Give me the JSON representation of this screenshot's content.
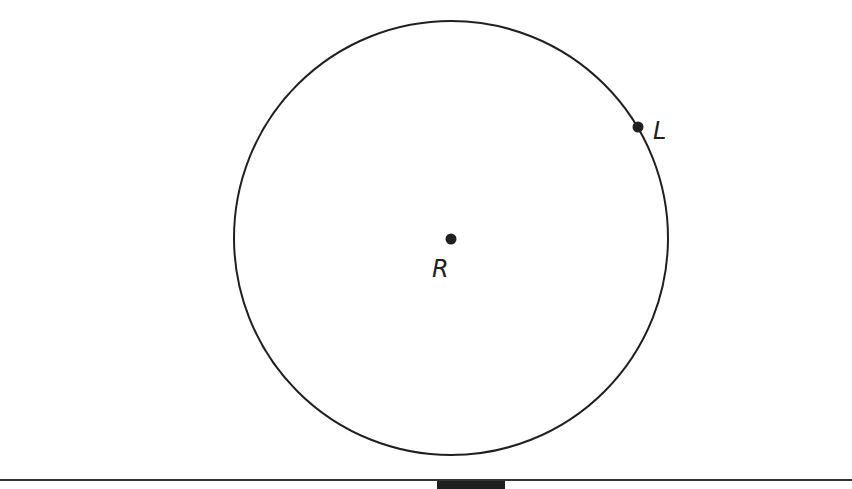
{
  "diagram": {
    "type": "geometry",
    "circle": {
      "center": [
        451,
        238
      ],
      "radius": 217,
      "stroke": "#231f20"
    },
    "points": [
      {
        "name": "R",
        "label": "R",
        "role": "center",
        "x": 451,
        "y": 239
      },
      {
        "name": "L",
        "label": "L",
        "role": "on-circle",
        "x": 638,
        "y": 127
      }
    ]
  },
  "labels": {
    "R": "R",
    "L": "L"
  },
  "colors": {
    "ink": "#231f20",
    "background": "#ffffff",
    "rule": "#333333"
  }
}
